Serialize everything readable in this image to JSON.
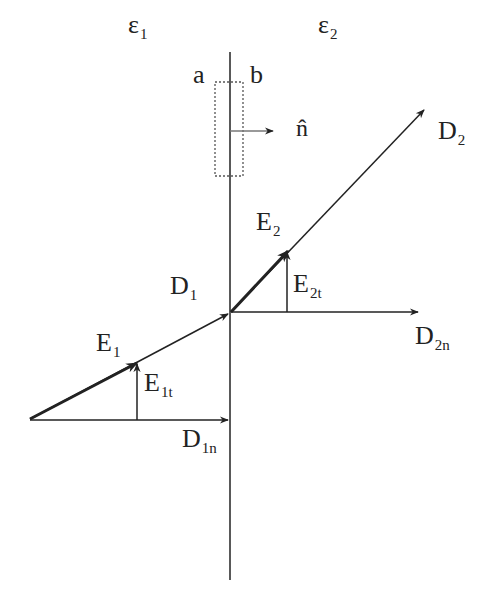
{
  "diagram": {
    "type": "boundary-conditions-dielectric-interface",
    "colors": {
      "line": "#222222",
      "dashed_box": "#555555",
      "normal_arrow": "#666666",
      "background": "#ffffff"
    },
    "regions": [
      {
        "id": "region-1",
        "symbol": "ε",
        "sub": "1"
      },
      {
        "id": "region-2",
        "symbol": "ε",
        "sub": "2"
      }
    ],
    "surface_labels": {
      "a": "a",
      "b": "b"
    },
    "normal": {
      "symbol": "n̂"
    },
    "vectors": {
      "D1": {
        "main": "D",
        "sub": "1"
      },
      "D2": {
        "main": "D",
        "sub": "2"
      },
      "E1": {
        "main": "E",
        "sub": "1"
      },
      "E2": {
        "main": "E",
        "sub": "2"
      },
      "E1t": {
        "main": "E",
        "sub": "1t"
      },
      "E2t": {
        "main": "E",
        "sub": "2t"
      },
      "D1n": {
        "main": "D",
        "sub": "1n"
      },
      "D2n": {
        "main": "D",
        "sub": "2n"
      }
    }
  }
}
